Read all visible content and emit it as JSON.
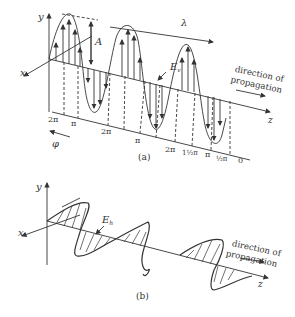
{
  "panel_a": {
    "caption": "(a)",
    "axis_y": "y",
    "axis_x": "x",
    "axis_z": "z",
    "amplitude_label": "A",
    "wavelength_label": "λ",
    "field_label": "E",
    "field_subscript": "v",
    "propagation_line1": "direction of",
    "propagation_line2": "propagation",
    "phase_label": "φ",
    "phase_ticks": [
      "2π",
      "π",
      "2π",
      "π",
      "2π",
      "1½π",
      "π",
      "½π",
      "0"
    ]
  },
  "panel_b": {
    "caption": "(b)",
    "axis_y": "y",
    "axis_x": "x",
    "axis_z": "z",
    "field_label": "E",
    "field_subscript": "h",
    "propagation_line1": "direction of",
    "propagation_line2": "propagation"
  },
  "colors": {
    "ink": "#333333",
    "background": "#ffffff"
  }
}
